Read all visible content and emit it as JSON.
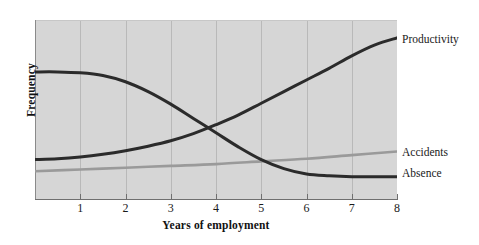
{
  "chart_data": {
    "type": "line",
    "title": "",
    "xlabel": "Years of employment",
    "ylabel": "Frequency",
    "xlim": [
      0,
      8
    ],
    "ylim": [
      0,
      1
    ],
    "xticks": [
      "1",
      "2",
      "3",
      "4",
      "5",
      "6",
      "7",
      "8"
    ],
    "yticks": [],
    "grid": "vertical",
    "legend_position": "right-of-plot-inline",
    "series": [
      {
        "name": "Productivity",
        "color": "#2b2b2b",
        "x": [
          0,
          0.5,
          1,
          1.5,
          2,
          2.5,
          3,
          3.5,
          4,
          4.5,
          5,
          5.5,
          6,
          6.5,
          7,
          7.5,
          8
        ],
        "y": [
          0.22,
          0.225,
          0.235,
          0.25,
          0.27,
          0.295,
          0.325,
          0.365,
          0.415,
          0.47,
          0.535,
          0.6,
          0.665,
          0.73,
          0.8,
          0.86,
          0.9
        ]
      },
      {
        "name": "Absence",
        "color": "#2b2b2b",
        "x": [
          0,
          0.5,
          1,
          1.5,
          2,
          2.5,
          3,
          3.5,
          4,
          4.5,
          5,
          5.5,
          6,
          6.5,
          7,
          7.5,
          8
        ],
        "y": [
          0.71,
          0.71,
          0.705,
          0.69,
          0.655,
          0.6,
          0.53,
          0.45,
          0.37,
          0.29,
          0.22,
          0.17,
          0.14,
          0.13,
          0.125,
          0.125,
          0.125
        ]
      },
      {
        "name": "Accidents",
        "color": "#9a9a9a",
        "x": [
          0,
          1,
          2,
          3,
          4,
          5,
          6,
          7,
          8
        ],
        "y": [
          0.155,
          0.165,
          0.175,
          0.185,
          0.195,
          0.21,
          0.225,
          0.245,
          0.265
        ]
      }
    ],
    "annotations": [
      {
        "name": "crossing-point",
        "x": 4.2,
        "note": "Productivity and Absence curves intersect"
      }
    ]
  },
  "labels": {
    "productivity": "Productivity",
    "accidents": "Accidents",
    "absence": "Absence"
  }
}
